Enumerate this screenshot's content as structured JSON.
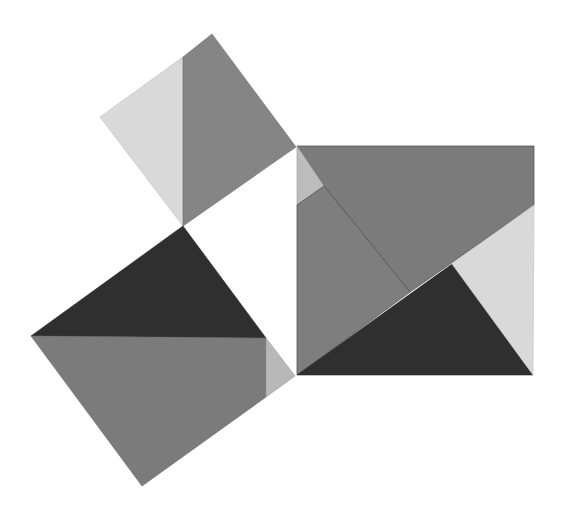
{
  "diagram": {
    "type": "pythagorean-dissection",
    "width": 563,
    "height": 514,
    "background": "#ffffff",
    "colors": {
      "light": "#d9d9d9",
      "medium": "#7b7b7b",
      "medium_alt": "#858585",
      "dark": "#2f2f2f",
      "edge": "#5a5a5a"
    },
    "shapes": {
      "small_square": {
        "light_piece": "183,57 100,117 183,226",
        "medium_piece": "183,57 212,34 296,147 183,226"
      },
      "left_square": {
        "dark_piece": "183,226 31,336 266,338",
        "medium_piece": "31,336 266,338 266,397 142,486",
        "light_piece": "266,338 295,376 266,397"
      },
      "right_square": {
        "top_medium_piece": "297,146 534,146 534,205 410,292 324,186",
        "light_top_left_piece": "297,146 324,186 297,205",
        "left_medium_piece": "297,205 324,186 410,292 297,375",
        "dark_piece": "297,375 452,264 533,375",
        "light_right_piece": "452,264 534,205 533,375"
      }
    }
  }
}
